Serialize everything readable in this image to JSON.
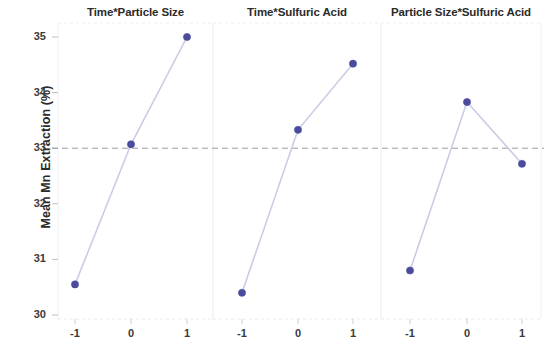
{
  "chart_data": {
    "type": "line",
    "title": "",
    "subtitle": "",
    "xlabel": "",
    "ylabel": "Mean Mn Extraction (%)",
    "ylim": [
      30,
      35
    ],
    "yticks": [
      30,
      31,
      32,
      33,
      34,
      35
    ],
    "ytick_labels": [
      "30",
      "31",
      "32",
      "33",
      "34",
      "35"
    ],
    "xtick_labels": [
      "-1",
      "0",
      "1"
    ],
    "grid": false,
    "legend": "none",
    "reference_line": {
      "value": 33.0,
      "style": "dashed",
      "color": "#9a9a9a"
    },
    "marker_color": "#4b4b9e",
    "line_color": "#c9cde4",
    "panels": [
      {
        "title": "Time*Particle Size",
        "x": [
          -1,
          0,
          1
        ],
        "values": [
          30.55,
          33.07,
          35.0
        ]
      },
      {
        "title": "Time*Sulfuric Acid",
        "x": [
          -1,
          0,
          1
        ],
        "values": [
          30.4,
          33.33,
          34.52
        ]
      },
      {
        "title": "Particle Size*Sulfuric Acid",
        "x": [
          -1,
          0,
          1
        ],
        "values": [
          30.8,
          33.83,
          32.72
        ]
      }
    ]
  }
}
